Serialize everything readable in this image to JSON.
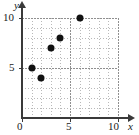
{
  "chart_data": {
    "type": "scatter",
    "title": "",
    "xlabel": "x",
    "ylabel": "y",
    "xlim": [
      0,
      10
    ],
    "ylim": [
      0,
      10
    ],
    "grid": true,
    "legend": null,
    "x_ticks": [
      {
        "value": 0,
        "label": "0"
      },
      {
        "value": 5,
        "label": "5"
      },
      {
        "value": 10,
        "label": "10"
      }
    ],
    "y_ticks": [
      {
        "value": 5,
        "label": "5"
      },
      {
        "value": 10,
        "label": "10"
      }
    ],
    "points": [
      {
        "x": 1,
        "y": 5
      },
      {
        "x": 2,
        "y": 4
      },
      {
        "x": 3,
        "y": 7
      },
      {
        "x": 4,
        "y": 8
      },
      {
        "x": 6,
        "y": 10
      }
    ],
    "marker": {
      "shape": "circle",
      "color": "#111111",
      "size": 7
    }
  },
  "style": {
    "axis_color": "#3a3a3a",
    "grid_color": "#b9b9b9",
    "grid_major_color": "#8f8f8f",
    "background": "#ffffff",
    "text_color": "#1a1a1a"
  }
}
